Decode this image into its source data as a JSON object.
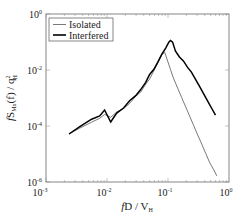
{
  "chart_data": {
    "type": "line",
    "title": "",
    "xlabel": "fD/V_H",
    "ylabel": "fS_Mx(f)/q_H^2",
    "xscale": "log",
    "yscale": "log",
    "xlim": [
      0.001,
      1
    ],
    "ylim": [
      1e-06,
      1
    ],
    "x_ticks": [
      "10^-3",
      "10^-2",
      "10^-1",
      "10^0"
    ],
    "y_ticks": [
      "10^0",
      "10^-2",
      "10^-4",
      "10^-6"
    ],
    "legend": {
      "position": "upper left",
      "entries": [
        "Isolated",
        "Interfered"
      ]
    },
    "grid": false,
    "series": [
      {
        "name": "Isolated",
        "style": "thin",
        "color": "#555555",
        "x": [
          0.00238,
          0.00358,
          0.0056,
          0.00758,
          0.00915,
          0.0115,
          0.0144,
          0.0187,
          0.0235,
          0.0296,
          0.0357,
          0.0431,
          0.05,
          0.0582,
          0.0677,
          0.0788,
          0.0882,
          0.0987,
          0.11,
          0.124,
          0.144,
          0.168,
          0.195,
          0.227,
          0.264,
          0.307,
          0.358,
          0.416,
          0.484,
          0.563,
          0.63
        ],
        "y": [
          5.18e-05,
          8.38e-05,
          0.000137,
          0.000189,
          0.00026,
          0.000205,
          0.000315,
          0.00042,
          0.000642,
          0.00116,
          0.00162,
          0.00311,
          0.00479,
          0.0091,
          0.0175,
          0.034,
          0.0431,
          0.0207,
          0.0103,
          0.00483,
          0.00224,
          0.00103,
          0.00048,
          0.000224,
          0.000103,
          4.79e-05,
          2.24e-05,
          1.03e-05,
          4.8e-06,
          2.7e-06,
          1.65e-06
        ]
      },
      {
        "name": "Interfered",
        "style": "thick",
        "color": "#000000",
        "x": [
          0.00238,
          0.00358,
          0.0056,
          0.00758,
          0.00915,
          0.0115,
          0.0144,
          0.0187,
          0.0235,
          0.0296,
          0.0357,
          0.0431,
          0.05,
          0.0582,
          0.0677,
          0.0788,
          0.0917,
          0.103,
          0.11,
          0.119,
          0.132,
          0.154,
          0.179,
          0.208,
          0.242,
          0.281,
          0.327,
          0.381,
          0.443,
          0.516,
          0.6
        ],
        "y": [
          5.18e-05,
          9.54e-05,
          0.000175,
          0.000229,
          0.000373,
          0.000139,
          0.00029,
          0.000438,
          0.000804,
          0.00121,
          0.00199,
          0.00362,
          0.0069,
          0.0104,
          0.0189,
          0.0361,
          0.0608,
          0.0988,
          0.113,
          0.0988,
          0.0478,
          0.0291,
          0.0211,
          0.0127,
          0.00844,
          0.00473,
          0.00264,
          0.00147,
          0.000804,
          0.000438,
          0.000244
        ]
      }
    ]
  },
  "axes": {
    "x_tick_labels": [
      {
        "base": "10",
        "exp": "-3"
      },
      {
        "base": "10",
        "exp": "-2"
      },
      {
        "base": "10",
        "exp": "-1"
      },
      {
        "base": "10",
        "exp": "0"
      }
    ],
    "y_tick_labels": [
      {
        "base": "10",
        "exp": "0"
      },
      {
        "base": "10",
        "exp": "-2"
      },
      {
        "base": "10",
        "exp": "-4"
      },
      {
        "base": "10",
        "exp": "-6"
      }
    ],
    "xlabel_parts": {
      "f": "f",
      "mid": "D / V",
      "sub": "H"
    },
    "ylabel_parts": {
      "f": "f",
      "S": "S",
      "sub1": "Mx",
      "mid": "(f) / q",
      "sup": "2",
      "sub2": "H"
    }
  },
  "legend": {
    "isolated": "Isolated",
    "interfered": "Interfered"
  }
}
